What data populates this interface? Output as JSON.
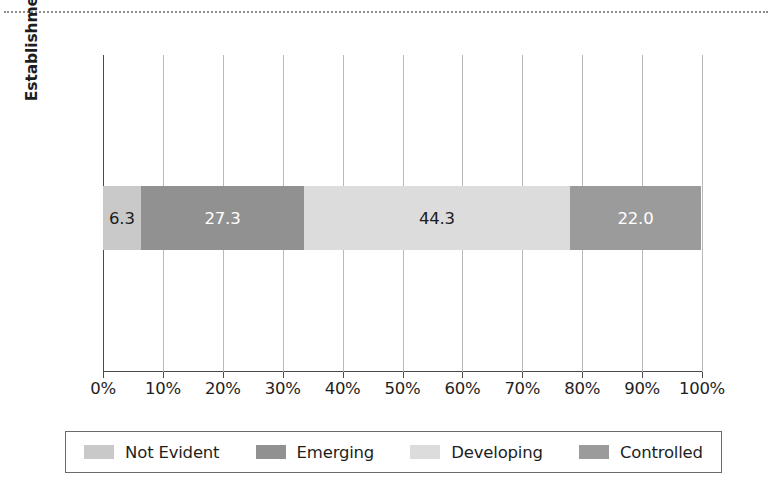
{
  "chart_data": {
    "type": "bar",
    "orientation": "horizontal",
    "stacked": true,
    "percent": true,
    "title": "",
    "xlabel": "",
    "ylabel": "Establishment of Advanced Relationships Between Ideas",
    "ylabel_lines": [
      "Establishment of Advanced Relationships",
      "Between Ideas"
    ],
    "categories": [
      "Establishment of Advanced Relationships Between Ideas"
    ],
    "xlim": [
      0,
      100
    ],
    "xticks": [
      0,
      10,
      20,
      30,
      40,
      50,
      60,
      70,
      80,
      90,
      100
    ],
    "xticklabels": [
      "0%",
      "10%",
      "20%",
      "30%",
      "40%",
      "50%",
      "60%",
      "70%",
      "80%",
      "90%",
      "100%"
    ],
    "grid": true,
    "grid_axis": "x",
    "legend_position": "bottom",
    "series": [
      {
        "name": "Not Evident",
        "values": [
          6.3
        ],
        "label": "6.3",
        "color": "#c9c9c9",
        "label_color": "dark"
      },
      {
        "name": "Emerging",
        "values": [
          27.3
        ],
        "label": "27.3",
        "color": "#919191",
        "label_color": "light"
      },
      {
        "name": "Developing",
        "values": [
          44.3
        ],
        "label": "44.3",
        "color": "#dcdcdc",
        "label_color": "dark"
      },
      {
        "name": "Controlled",
        "values": [
          22.0
        ],
        "label": "22.0",
        "color": "#9b9b9b",
        "label_color": "light"
      }
    ]
  },
  "legend": {
    "items": [
      {
        "label": "Not Evident",
        "color": "#c9c9c9"
      },
      {
        "label": "Emerging",
        "color": "#919191"
      },
      {
        "label": "Developing",
        "color": "#dcdcdc"
      },
      {
        "label": "Controlled",
        "color": "#9b9b9b"
      }
    ]
  },
  "colors": {
    "axis": "#4a4a4a",
    "grid": "#b9b9b9",
    "text": "#1e1e1e",
    "background": "#ffffff",
    "top_rule": "#8d8d8d"
  }
}
